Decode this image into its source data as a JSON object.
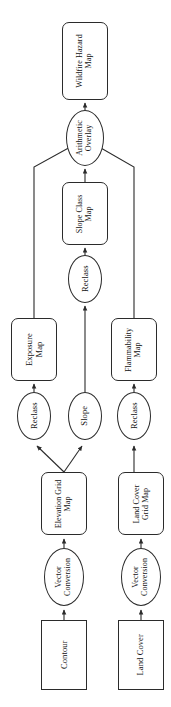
{
  "figure": {
    "orientation": "rotated-90-clockwise",
    "background_color": "#ffffff",
    "line_color": "#2b2b2b"
  },
  "nodes": [
    {
      "id": "wildfire-hazard-map",
      "label": "Wildfire Hazard\nMap",
      "shape": "rounded-rect",
      "role": "output-dataset",
      "x": 62,
      "y": 22,
      "w": 46,
      "h": 78
    },
    {
      "id": "arithmetic-overlay",
      "label": "Arithmetic\nOverlay",
      "shape": "ellipse",
      "role": "process",
      "x": 66,
      "y": 110,
      "w": 38,
      "h": 56
    },
    {
      "id": "exposure-map",
      "label": "Exposure\nMap",
      "shape": "rounded-rect",
      "role": "dataset",
      "x": 11,
      "y": 318,
      "w": 46,
      "h": 63
    },
    {
      "id": "slope-class-map",
      "label": "Slope Class\nMap",
      "shape": "rounded-rect",
      "role": "dataset",
      "x": 62,
      "y": 182,
      "w": 46,
      "h": 63
    },
    {
      "id": "flammability-map",
      "label": "Flammability\nMap",
      "shape": "rounded-rect",
      "role": "dataset",
      "x": 111,
      "y": 318,
      "w": 46,
      "h": 63
    },
    {
      "id": "reclass-slope-class",
      "label": "Reclass",
      "shape": "ellipse",
      "role": "process",
      "x": 68,
      "y": 255,
      "w": 34,
      "h": 48
    },
    {
      "id": "reclass-exposure",
      "label": "Reclass",
      "shape": "ellipse",
      "role": "process",
      "x": 17,
      "y": 392,
      "w": 34,
      "h": 48
    },
    {
      "id": "slope",
      "label": "Slope",
      "shape": "ellipse",
      "role": "process",
      "x": 68,
      "y": 392,
      "w": 34,
      "h": 48
    },
    {
      "id": "reclass-flammability",
      "label": "Reclass",
      "shape": "ellipse",
      "role": "process",
      "x": 117,
      "y": 392,
      "w": 34,
      "h": 48
    },
    {
      "id": "elevation-grid-map",
      "label": "Elevation Grid\nMap",
      "shape": "rounded-rect",
      "role": "dataset",
      "x": 41,
      "y": 472,
      "w": 46,
      "h": 63
    },
    {
      "id": "land-cover-grid-map",
      "label": "Land Cover\nGrid Map",
      "shape": "rounded-rect",
      "role": "dataset",
      "x": 118,
      "y": 472,
      "w": 46,
      "h": 63
    },
    {
      "id": "vector-conversion-elevation",
      "label": "Vector\nConversion",
      "shape": "ellipse",
      "role": "process",
      "x": 44,
      "y": 548,
      "w": 40,
      "h": 58
    },
    {
      "id": "vector-conversion-land-cover",
      "label": "Vector\nConversion",
      "shape": "ellipse",
      "role": "process",
      "x": 121,
      "y": 548,
      "w": 40,
      "h": 58
    },
    {
      "id": "contour",
      "label": "Contour",
      "shape": "rect",
      "role": "input-dataset",
      "x": 41,
      "y": 620,
      "w": 46,
      "h": 70
    },
    {
      "id": "land-cover",
      "label": "Land Cover",
      "shape": "rect",
      "role": "input-dataset",
      "x": 118,
      "y": 620,
      "w": 46,
      "h": 70
    }
  ],
  "edges": [
    {
      "id": "e-overlay-to-hazard",
      "from": "arithmetic-overlay",
      "to": "wildfire-hazard-map",
      "path": "M 85,110 L 85,103",
      "arrow": true
    },
    {
      "id": "e-slopeclass-to-overlay",
      "from": "slope-class-map",
      "to": "arithmetic-overlay",
      "path": "M 85,182 L 85,169",
      "arrow": true
    },
    {
      "id": "e-exposure-to-overlay",
      "from": "exposure-map",
      "to": "arithmetic-overlay",
      "path": "M 34,318 L 34,167 L 83,140",
      "arrow": false
    },
    {
      "id": "e-flammability-to-overlay",
      "from": "flammability-map",
      "to": "arithmetic-overlay",
      "path": "M 134,318 L 134,167 L 87,140",
      "arrow": false
    },
    {
      "id": "e-reclass-to-slopeclass",
      "from": "reclass-slope-class",
      "to": "slope-class-map",
      "path": "M 85,255 L 85,248",
      "arrow": true
    },
    {
      "id": "e-slope-to-reclass",
      "from": "slope",
      "to": "reclass-slope-class",
      "path": "M 85,392 L 85,306",
      "arrow": true
    },
    {
      "id": "e-reclass-to-exposure",
      "from": "reclass-exposure",
      "to": "exposure-map",
      "path": "M 34,392 L 34,384",
      "arrow": true
    },
    {
      "id": "e-reclass-to-flammability",
      "from": "reclass-flammability",
      "to": "flammability-map",
      "path": "M 134,392 L 134,384",
      "arrow": true
    },
    {
      "id": "e-elevation-to-reclass",
      "from": "elevation-grid-map",
      "to": "reclass-exposure",
      "path": "M 64,472 L 37,446",
      "arrow": true
    },
    {
      "id": "e-elevation-to-slope",
      "from": "elevation-grid-map",
      "to": "slope",
      "path": "M 64,472 L 82,446",
      "arrow": true
    },
    {
      "id": "e-landcovergrid-to-reclass",
      "from": "land-cover-grid-map",
      "to": "reclass-flammability",
      "path": "M 134,472 L 134,446",
      "arrow": true
    },
    {
      "id": "e-vc-to-elevation",
      "from": "vector-conversion-elevation",
      "to": "elevation-grid-map",
      "path": "M 64,548 L 64,539",
      "arrow": true
    },
    {
      "id": "e-vc-to-landcovergrid",
      "from": "vector-conversion-land-cover",
      "to": "land-cover-grid-map",
      "path": "M 141,548 L 141,539",
      "arrow": true
    },
    {
      "id": "e-contour-to-vc",
      "from": "contour",
      "to": "vector-conversion-elevation",
      "path": "M 64,620 L 64,610",
      "arrow": true
    },
    {
      "id": "e-landcover-to-vc",
      "from": "land-cover",
      "to": "vector-conversion-land-cover",
      "path": "M 141,620 L 141,610",
      "arrow": true
    }
  ]
}
